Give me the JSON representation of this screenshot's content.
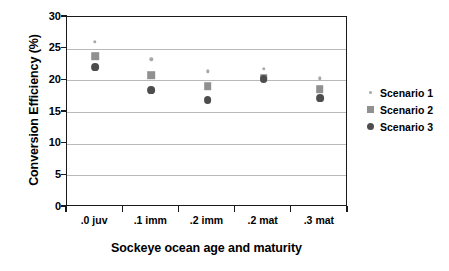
{
  "chart_data": {
    "type": "scatter",
    "title": "",
    "xlabel": "Sockeye ocean age and maturity",
    "ylabel": "Conversion Efficiency (%)",
    "categories": [
      ".0 juv",
      ".1 imm",
      ".2 imm",
      ".2 mat",
      ".3 mat"
    ],
    "ylim": [
      0,
      30
    ],
    "yticks": [
      0,
      5,
      10,
      15,
      20,
      25,
      30
    ],
    "ytick_labels": [
      "0",
      "5",
      "10",
      "15",
      "20",
      "25",
      "30"
    ],
    "grid": "horizontal",
    "legend_position": "right",
    "series": [
      {
        "name": "Scenario 1",
        "marker": "small-dot",
        "color": "#a8a8a8",
        "values": [
          26.1,
          23.3,
          21.4,
          21.8,
          20.3
        ]
      },
      {
        "name": "Scenario 2",
        "marker": "square",
        "color": "#909090",
        "values": [
          23.8,
          20.8,
          19.1,
          20.4,
          18.6
        ]
      },
      {
        "name": "Scenario 3",
        "marker": "circle",
        "color": "#4d4d4d",
        "values": [
          22.1,
          18.4,
          16.9,
          20.2,
          17.2
        ]
      }
    ]
  },
  "axes": {
    "y_title": "Conversion Efficiency (%)",
    "x_title": "Sockeye ocean age and maturity"
  },
  "legend": {
    "items": [
      {
        "label": "Scenario 1"
      },
      {
        "label": "Scenario 2"
      },
      {
        "label": "Scenario 3"
      }
    ]
  },
  "colors": {
    "scenario1": "#a8a8a8",
    "scenario2": "#909090",
    "scenario3": "#4d4d4d",
    "axis": "#1a1a1a",
    "gridline": "#b9b9b9",
    "background": "#ffffff"
  }
}
